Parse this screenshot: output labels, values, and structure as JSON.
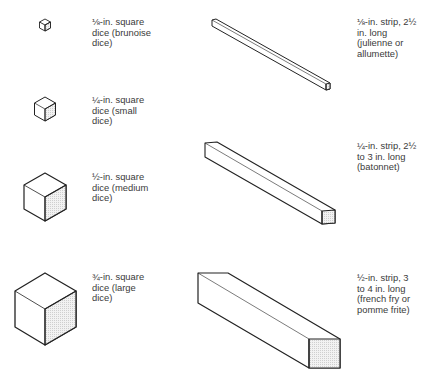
{
  "colors": {
    "stroke": "#222222",
    "shade": "#e4e4e4",
    "text": "#3a3a3a"
  },
  "dice": [
    {
      "id": "brunoise",
      "lines": [
        "⅛-in. square",
        "dice (brunoise",
        "dice)"
      ]
    },
    {
      "id": "small",
      "lines": [
        "¼-in. square",
        "dice (small",
        "dice)"
      ]
    },
    {
      "id": "medium",
      "lines": [
        "½-in. square",
        "dice (medium",
        "dice)"
      ]
    },
    {
      "id": "large",
      "lines": [
        "¾-in. square",
        "dice (large",
        "dice)"
      ]
    }
  ],
  "strips": [
    {
      "id": "julienne",
      "lines": [
        "⅛-in. strip, 2½",
        "in. long",
        "(julienne or",
        "allumette)"
      ]
    },
    {
      "id": "batonnet",
      "lines": [
        "¼-in. strip, 2½",
        "to 3 in. long",
        "(batonnet)"
      ]
    },
    {
      "id": "french-fry",
      "lines": [
        "½-in. strip, 3",
        "to 4 in. long",
        "(french fry or",
        "pomme frite)"
      ]
    }
  ]
}
